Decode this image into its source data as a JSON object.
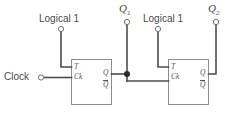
{
  "diagram": {
    "background_color": "#ffffff",
    "wire_color": "#4c4c52",
    "box_stroke_color": "#8c8c92",
    "text_color": "#4a4a4a",
    "junction_color": "#2b2b2f"
  },
  "labels": {
    "clock": "Clock",
    "logical_one_left": "Logical 1",
    "logical_one_right": "Logical 1",
    "output_q1": "Q",
    "output_q1_sub": "1",
    "output_q2": "Q",
    "output_q2_sub": "2"
  },
  "flipflops": [
    {
      "id": "flipflop-1",
      "inputs": {
        "t": "T",
        "clock": "Ck"
      },
      "outputs": {
        "q": "Q",
        "qbar": "Q"
      }
    },
    {
      "id": "flipflop-2",
      "inputs": {
        "t": "T",
        "clock": "Ck"
      },
      "outputs": {
        "q": "Q",
        "qbar": "Q"
      }
    }
  ],
  "terminals": [
    {
      "name": "clock-terminal",
      "type": "open-circle"
    },
    {
      "name": "logical-one-terminal-left",
      "type": "open-circle"
    },
    {
      "name": "logical-one-terminal-right",
      "type": "open-circle"
    },
    {
      "name": "q1-terminal",
      "type": "open-circle"
    },
    {
      "name": "q2-terminal",
      "type": "open-circle"
    },
    {
      "name": "q1-junction",
      "type": "filled-dot"
    }
  ]
}
